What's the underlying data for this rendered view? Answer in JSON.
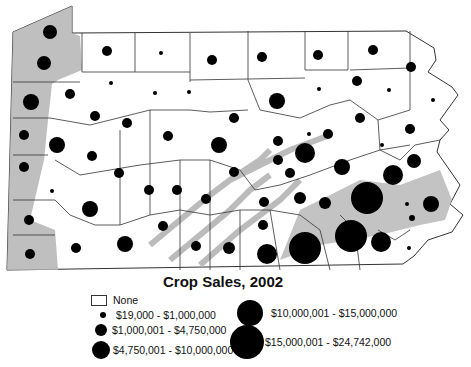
{
  "map": {
    "title": "Crop Sales, 2002",
    "region": "Pennsylvania counties",
    "colors": {
      "background": "#ffffff",
      "county_fill": "#ffffff",
      "terrain_shade": "#b4b4b4",
      "border": "#333333",
      "symbol": "#000000"
    }
  },
  "legend": {
    "none_label": "None",
    "classes": [
      {
        "label": "$19,000 - $1,000,000",
        "radius": 3
      },
      {
        "label": "$1,000,001 - $4,750,000",
        "radius": 6
      },
      {
        "label": "$4,750,001 - $10,000,000",
        "radius": 9
      },
      {
        "label": "$10,000,001 - $15,000,000",
        "radius": 13
      },
      {
        "label": "$15,000,001 - $24,742,000",
        "radius": 17
      }
    ]
  },
  "symbols": [
    {
      "x": 50,
      "y": 32,
      "r": 7
    },
    {
      "x": 44,
      "y": 63,
      "r": 7
    },
    {
      "x": 31,
      "y": 102,
      "r": 8
    },
    {
      "x": 24,
      "y": 135,
      "r": 5
    },
    {
      "x": 24,
      "y": 167,
      "r": 5
    },
    {
      "x": 29,
      "y": 220,
      "r": 5
    },
    {
      "x": 30,
      "y": 254,
      "r": 5
    },
    {
      "x": 107,
      "y": 51,
      "r": 5
    },
    {
      "x": 161,
      "y": 53,
      "r": 2
    },
    {
      "x": 212,
      "y": 60,
      "r": 5
    },
    {
      "x": 262,
      "y": 57,
      "r": 5
    },
    {
      "x": 318,
      "y": 55,
      "r": 5
    },
    {
      "x": 373,
      "y": 50,
      "r": 5
    },
    {
      "x": 111,
      "y": 83,
      "r": 2
    },
    {
      "x": 155,
      "y": 93,
      "r": 2
    },
    {
      "x": 189,
      "y": 92,
      "r": 2
    },
    {
      "x": 70,
      "y": 94,
      "r": 5
    },
    {
      "x": 95,
      "y": 116,
      "r": 5
    },
    {
      "x": 57,
      "y": 145,
      "r": 8
    },
    {
      "x": 127,
      "y": 123,
      "r": 5
    },
    {
      "x": 168,
      "y": 136,
      "r": 5
    },
    {
      "x": 234,
      "y": 118,
      "r": 5
    },
    {
      "x": 277,
      "y": 101,
      "r": 8
    },
    {
      "x": 319,
      "y": 89,
      "r": 2
    },
    {
      "x": 357,
      "y": 81,
      "r": 5
    },
    {
      "x": 389,
      "y": 90,
      "r": 2
    },
    {
      "x": 411,
      "y": 67,
      "r": 5
    },
    {
      "x": 433,
      "y": 100,
      "r": 2
    },
    {
      "x": 360,
      "y": 118,
      "r": 5
    },
    {
      "x": 410,
      "y": 129,
      "r": 5
    },
    {
      "x": 92,
      "y": 156,
      "r": 5
    },
    {
      "x": 52,
      "y": 191,
      "r": 2
    },
    {
      "x": 90,
      "y": 209,
      "r": 8
    },
    {
      "x": 119,
      "y": 173,
      "r": 5
    },
    {
      "x": 149,
      "y": 190,
      "r": 5
    },
    {
      "x": 177,
      "y": 190,
      "r": 5
    },
    {
      "x": 206,
      "y": 199,
      "r": 5
    },
    {
      "x": 219,
      "y": 145,
      "r": 8
    },
    {
      "x": 234,
      "y": 172,
      "r": 5
    },
    {
      "x": 278,
      "y": 141,
      "r": 5
    },
    {
      "x": 278,
      "y": 160,
      "r": 5
    },
    {
      "x": 309,
      "y": 134,
      "r": 2
    },
    {
      "x": 328,
      "y": 134,
      "r": 5
    },
    {
      "x": 305,
      "y": 153,
      "r": 10
    },
    {
      "x": 264,
      "y": 202,
      "r": 5
    },
    {
      "x": 263,
      "y": 225,
      "r": 5
    },
    {
      "x": 290,
      "y": 173,
      "r": 5
    },
    {
      "x": 300,
      "y": 198,
      "r": 6
    },
    {
      "x": 325,
      "y": 203,
      "r": 6
    },
    {
      "x": 342,
      "y": 167,
      "r": 8
    },
    {
      "x": 382,
      "y": 145,
      "r": 2
    },
    {
      "x": 414,
      "y": 161,
      "r": 7
    },
    {
      "x": 393,
      "y": 175,
      "r": 10
    },
    {
      "x": 367,
      "y": 198,
      "r": 16
    },
    {
      "x": 351,
      "y": 236,
      "r": 16
    },
    {
      "x": 381,
      "y": 242,
      "r": 10
    },
    {
      "x": 412,
      "y": 218,
      "r": 3
    },
    {
      "x": 407,
      "y": 204,
      "r": 2
    },
    {
      "x": 431,
      "y": 204,
      "r": 8
    },
    {
      "x": 409,
      "y": 248,
      "r": 2
    },
    {
      "x": 305,
      "y": 248,
      "r": 16
    },
    {
      "x": 267,
      "y": 254,
      "r": 10
    },
    {
      "x": 229,
      "y": 248,
      "r": 6
    },
    {
      "x": 196,
      "y": 246,
      "r": 5
    },
    {
      "x": 163,
      "y": 226,
      "r": 5
    },
    {
      "x": 125,
      "y": 244,
      "r": 8
    },
    {
      "x": 76,
      "y": 248,
      "r": 5
    }
  ]
}
